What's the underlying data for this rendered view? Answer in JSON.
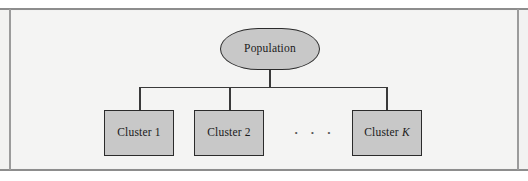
{
  "figure": {
    "type": "tree-diagram",
    "root": {
      "label": "Population",
      "shape": "capsule"
    },
    "leaves": [
      {
        "label": "Cluster 1",
        "shape": "rectangle"
      },
      {
        "label": "Cluster 2",
        "shape": "rectangle"
      },
      {
        "label": "Cluster K",
        "label_prefix": "Cluster ",
        "label_suffix": "K",
        "shape": "rectangle",
        "suffix_italic": true
      }
    ],
    "ellipsis": {
      "label": ". . .",
      "dots": [
        "·",
        "·",
        "·"
      ]
    },
    "colors": {
      "node_fill": "#c8c8c8",
      "node_border": "#2b2b2b",
      "connector": "#3a3a3a",
      "page_background": "#f2f2f1",
      "frame_rule": "#8d8d8d",
      "text": "#1a1a1a"
    }
  }
}
